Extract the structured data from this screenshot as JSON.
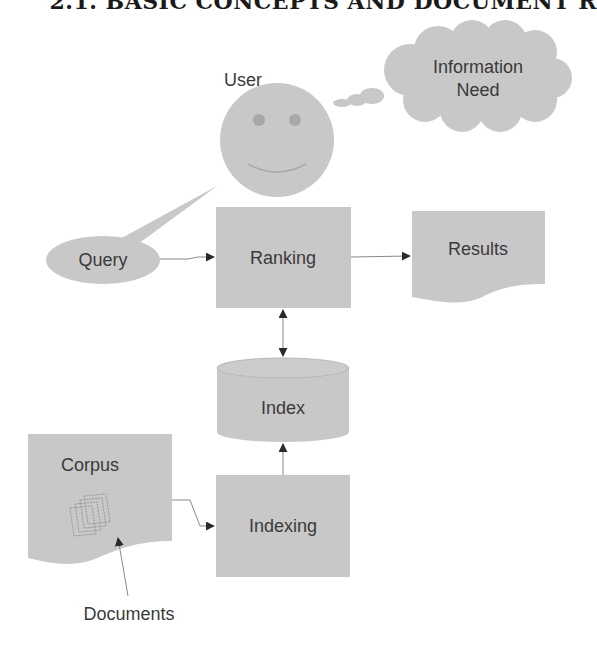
{
  "header": {
    "text": "2.1. BASIC CONCEPTS AND DOCUMENT R"
  },
  "diagram": {
    "nodes": {
      "user": {
        "label": "User",
        "shape": "smiley-face"
      },
      "information_need": {
        "label": "Information Need",
        "line1": "Information",
        "line2": "Need",
        "shape": "thought-cloud"
      },
      "query": {
        "label": "Query",
        "shape": "speech-bubble-ellipse"
      },
      "ranking": {
        "label": "Ranking",
        "shape": "rectangle"
      },
      "results": {
        "label": "Results",
        "shape": "document"
      },
      "index": {
        "label": "Index",
        "shape": "cylinder"
      },
      "indexing": {
        "label": "Indexing",
        "shape": "rectangle"
      },
      "corpus": {
        "label": "Corpus",
        "shape": "document"
      },
      "documents": {
        "label": "Documents",
        "shape": "callout-label"
      }
    },
    "edges": [
      {
        "from": "Query",
        "to": "Ranking",
        "direction": "forward"
      },
      {
        "from": "Ranking",
        "to": "Results",
        "direction": "forward"
      },
      {
        "from": "Ranking",
        "to": "Index",
        "direction": "bidirectional"
      },
      {
        "from": "Indexing",
        "to": "Index",
        "direction": "forward"
      },
      {
        "from": "Corpus",
        "to": "Indexing",
        "direction": "forward"
      },
      {
        "from": "Documents",
        "to": "Corpus documents icon",
        "direction": "forward"
      }
    ],
    "colors": {
      "shape_fill": "#c8c8c8",
      "text": "#3a3a3a",
      "arrowhead": "#2a2a2a",
      "edge": "#8a8a8a"
    }
  }
}
